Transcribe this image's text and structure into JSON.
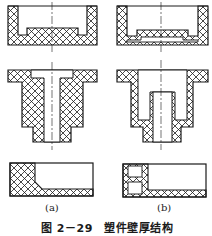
{
  "figure": {
    "caption_number": "图 2－29",
    "caption_title": "塑件壁厚结构",
    "panels": [
      {
        "label": "(a)",
        "description": "Uneven wall thickness (poor design)"
      },
      {
        "label": "(b)",
        "description": "Uniform wall thickness (improved design)"
      }
    ]
  },
  "style": {
    "line_color": "#1a1a1a",
    "hatch_color": "#1a1a1a",
    "background": "#ffffff"
  }
}
